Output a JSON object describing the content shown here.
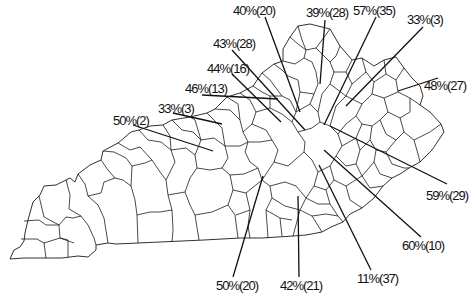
{
  "map": {
    "subject": "Kentucky county outline map with callout statistics",
    "stroke_color": "#1a1a1a",
    "background": "#ffffff"
  },
  "callouts": [
    {
      "id": "c1",
      "text": "40%(20)",
      "label_x": 233,
      "label_y": 4,
      "line": [
        265,
        17,
        300,
        112
      ]
    },
    {
      "id": "c2",
      "text": "39%(28)",
      "label_x": 306,
      "label_y": 6,
      "line": [
        325,
        20,
        320,
        84
      ]
    },
    {
      "id": "c3",
      "text": "57%(35)",
      "label_x": 353,
      "label_y": 4,
      "line": [
        376,
        17,
        324,
        125
      ]
    },
    {
      "id": "c4",
      "text": "33%(3)",
      "label_x": 407,
      "label_y": 13,
      "line": [
        423,
        27,
        346,
        106
      ]
    },
    {
      "id": "c5",
      "text": "43%(28)",
      "label_x": 213,
      "label_y": 37,
      "line": [
        232,
        50,
        305,
        130
      ]
    },
    {
      "id": "c6",
      "text": "48%(27)",
      "label_x": 424,
      "label_y": 79,
      "line": [
        438,
        78,
        398,
        91
      ]
    },
    {
      "id": "c7",
      "text": "44%(16)",
      "label_x": 207,
      "label_y": 62,
      "line": [
        232,
        74,
        281,
        122
      ]
    },
    {
      "id": "c8",
      "text": "46%(13)",
      "label_x": 185,
      "label_y": 82,
      "line": [
        202,
        95,
        278,
        99
      ]
    },
    {
      "id": "c9",
      "text": "33%(3)",
      "label_x": 158,
      "label_y": 102,
      "line": [
        173,
        113,
        222,
        124
      ]
    },
    {
      "id": "c10",
      "text": "50%(2)",
      "label_x": 113,
      "label_y": 114,
      "line": [
        133,
        125,
        213,
        151
      ]
    },
    {
      "id": "c11",
      "text": "59%(29)",
      "label_x": 426,
      "label_y": 189,
      "line": [
        447,
        184,
        330,
        126
      ]
    },
    {
      "id": "c12",
      "text": "60%(10)",
      "label_x": 402,
      "label_y": 239,
      "line": [
        421,
        237,
        324,
        150
      ]
    },
    {
      "id": "c13",
      "text": "11%(37)",
      "label_x": 357,
      "label_y": 272,
      "line": [
        371,
        270,
        319,
        165
      ]
    },
    {
      "id": "c14",
      "text": "42%(21)",
      "label_x": 280,
      "label_y": 279,
      "line": [
        299,
        277,
        298,
        196
      ]
    },
    {
      "id": "c15",
      "text": "50%(20)",
      "label_x": 216,
      "label_y": 279,
      "line": [
        233,
        277,
        263,
        176
      ]
    }
  ]
}
